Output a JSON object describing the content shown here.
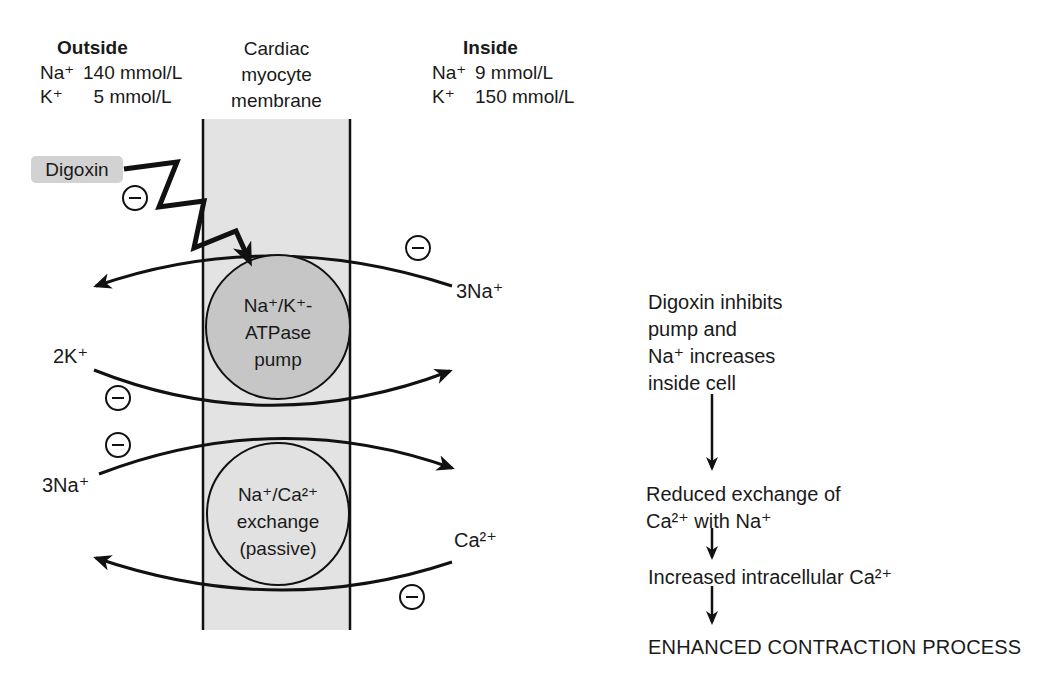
{
  "header": {
    "outside": {
      "title": "Outside",
      "rows": [
        {
          "ion": "Na⁺",
          "value": "140 mmol/L"
        },
        {
          "ion": "K⁺",
          "value": "  5 mmol/L"
        }
      ]
    },
    "membrane": {
      "lines": [
        "Cardiac",
        "myocyte",
        "membrane"
      ]
    },
    "inside": {
      "title": "Inside",
      "rows": [
        {
          "ion": "Na⁺",
          "value": "9 mmol/L"
        },
        {
          "ion": "K⁺",
          "value": "150 mmol/L"
        }
      ]
    }
  },
  "diagram": {
    "digoxin_label": "Digoxin",
    "pump": {
      "lines": [
        "Na⁺/K⁺-",
        "ATPase",
        "pump"
      ]
    },
    "exchange": {
      "lines": [
        "Na⁺/Ca²⁺",
        "exchange",
        "(passive)"
      ]
    },
    "ions": {
      "na_out": "3Na⁺",
      "k_in": "2K⁺",
      "na_in": "3Na⁺",
      "ca_out": "Ca²⁺"
    },
    "inhibition_icon": "⊖"
  },
  "flow": {
    "step1": [
      "Digoxin inhibits",
      "pump and",
      "Na⁺ increases",
      "inside cell"
    ],
    "step2": [
      "Reduced exchange of",
      "Ca²⁺ with Na⁺"
    ],
    "step3": "Increased intracellular Ca²⁺",
    "step4": "ENHANCED CONTRACTION PROCESS"
  },
  "colors": {
    "membrane_fill": "#e3e3e3",
    "pump_fill": "#c6c6c6",
    "exchange_fill": "#e1e1e1",
    "digoxin_bg": "#d2d2d2",
    "line": "#111111"
  }
}
